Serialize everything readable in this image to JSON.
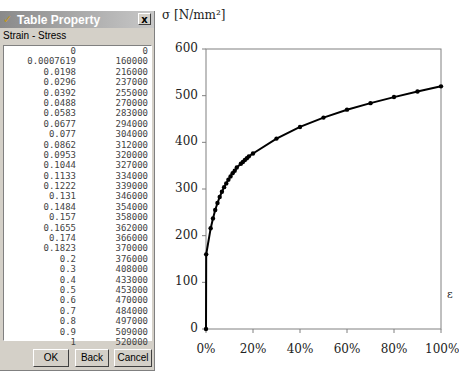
{
  "dialog": {
    "title": "Table Property",
    "close_label": "x",
    "subtitle": "Strain - Stress",
    "rows": [
      [
        "0",
        "0"
      ],
      [
        "0.0007619",
        "160000"
      ],
      [
        "0.0198",
        "216000"
      ],
      [
        "0.0296",
        "237000"
      ],
      [
        "0.0392",
        "255000"
      ],
      [
        "0.0488",
        "270000"
      ],
      [
        "0.0583",
        "283000"
      ],
      [
        "0.0677",
        "294000"
      ],
      [
        "0.077",
        "304000"
      ],
      [
        "0.0862",
        "312000"
      ],
      [
        "0.0953",
        "320000"
      ],
      [
        "0.1044",
        "327000"
      ],
      [
        "0.1133",
        "334000"
      ],
      [
        "0.1222",
        "339000"
      ],
      [
        "0.131",
        "346000"
      ],
      [
        "0.1484",
        "354000"
      ],
      [
        "0.157",
        "358000"
      ],
      [
        "0.1655",
        "362000"
      ],
      [
        "0.174",
        "366000"
      ],
      [
        "0.1823",
        "370000"
      ],
      [
        "0.2",
        "376000"
      ],
      [
        "0.3",
        "408000"
      ],
      [
        "0.4",
        "433000"
      ],
      [
        "0.5",
        "453000"
      ],
      [
        "0.6",
        "470000"
      ],
      [
        "0.7",
        "484000"
      ],
      [
        "0.8",
        "497000"
      ],
      [
        "0.9",
        "509000"
      ],
      [
        "1",
        "520000"
      ]
    ],
    "buttons": {
      "ok": "OK",
      "back": "Back",
      "cancel": "Cancel"
    }
  },
  "chart_data": {
    "type": "line",
    "title": "",
    "ylabel": "σ [N/mm²]",
    "xlabel": "ε",
    "ylim": [
      0,
      600
    ],
    "xlim": [
      0,
      1
    ],
    "yticks": [
      "0",
      "100",
      "200",
      "300",
      "400",
      "500",
      "600"
    ],
    "xticks": [
      "0%",
      "20%",
      "40%",
      "60%",
      "80%",
      "100%"
    ],
    "grid": false,
    "x": [
      0,
      0.0007619,
      0.0198,
      0.0296,
      0.0392,
      0.0488,
      0.0583,
      0.0677,
      0.077,
      0.0862,
      0.0953,
      0.1044,
      0.1133,
      0.1222,
      0.131,
      0.1484,
      0.157,
      0.1655,
      0.174,
      0.1823,
      0.2,
      0.3,
      0.4,
      0.5,
      0.6,
      0.7,
      0.8,
      0.9,
      1
    ],
    "series": [
      {
        "name": "Strain - Stress",
        "values": [
          0,
          160,
          216,
          237,
          255,
          270,
          283,
          294,
          304,
          312,
          320,
          327,
          334,
          339,
          346,
          354,
          358,
          362,
          366,
          370,
          376,
          408,
          433,
          453,
          470,
          484,
          497,
          509,
          520
        ]
      }
    ]
  }
}
